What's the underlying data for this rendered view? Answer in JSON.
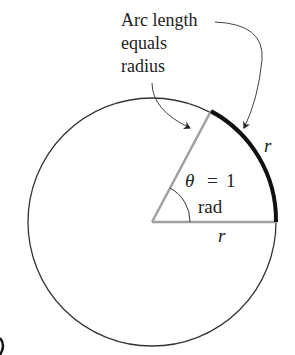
{
  "diagram": {
    "annotation": {
      "line1": "Arc length",
      "line2": "equals",
      "line3": "radius"
    },
    "angle_label": {
      "theta": "θ",
      "equals": "=",
      "value": "1",
      "unit": "rad"
    },
    "arc_label": "r",
    "radius_label": "r",
    "colors": {
      "circle": "#333333",
      "radius_lines": "#a0a0a0",
      "arc_highlight": "#111111",
      "text": "#222222"
    }
  }
}
